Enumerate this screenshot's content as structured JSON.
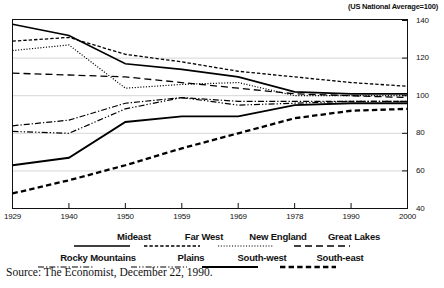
{
  "subtitle": "(US National Average=100)",
  "source": "Source: The Economist, December 22, 1990.",
  "axes": {
    "y_ticks": [
      "40",
      "60",
      "80",
      "100",
      "120",
      "140"
    ],
    "x_ticks": [
      "1929",
      "1940",
      "1950",
      "1959",
      "1969",
      "1978",
      "1990",
      "2000"
    ]
  },
  "legend": {
    "row1": [
      {
        "label": "Mideast",
        "style": "solid"
      },
      {
        "label": "Far West",
        "style": "dash"
      },
      {
        "label": "New England",
        "style": "dot"
      },
      {
        "label": "Great Lakes",
        "style": "longdash"
      }
    ],
    "row2": [
      {
        "label": "Rocky Mountains",
        "style": "dashdot"
      },
      {
        "label": "Plains",
        "style": "dashdotdot"
      },
      {
        "label": "South-west",
        "style": "solid2"
      },
      {
        "label": "South-east",
        "style": "bolddash"
      }
    ]
  },
  "chart_data": {
    "type": "line",
    "title": "",
    "subtitle": "(US National Average=100)",
    "xlabel": "",
    "ylabel": "",
    "ylim": [
      40,
      140
    ],
    "xlim": [
      1929,
      2000
    ],
    "grid": true,
    "legend_position": "below",
    "x": [
      1929,
      1940,
      1950,
      1959,
      1969,
      1978,
      1990,
      2000
    ],
    "series": [
      {
        "name": "Mideast",
        "style": "solid",
        "values": [
          138,
          132,
          117,
          114,
          110,
          102,
          101,
          101
        ]
      },
      {
        "name": "Far West",
        "style": "dash",
        "values": [
          129,
          131,
          122,
          118,
          113,
          110,
          107,
          105
        ]
      },
      {
        "name": "New England",
        "style": "dot",
        "values": [
          124,
          127,
          104,
          106,
          107,
          100,
          100,
          100
        ]
      },
      {
        "name": "Great Lakes",
        "style": "longdash",
        "values": [
          112,
          111,
          110,
          107,
          104,
          101,
          100,
          99
        ]
      },
      {
        "name": "Rocky Mountains",
        "style": "dashdot",
        "values": [
          84,
          87,
          96,
          99,
          97,
          97,
          97,
          97
        ]
      },
      {
        "name": "Plains",
        "style": "dashdotdot",
        "values": [
          81,
          80,
          93,
          99,
          95,
          96,
          97,
          97
        ]
      },
      {
        "name": "South-west",
        "style": "solid2",
        "values": [
          63,
          67,
          86,
          89,
          89,
          95,
          96,
          96
        ]
      },
      {
        "name": "South-east",
        "style": "bolddash",
        "values": [
          48,
          55,
          63,
          72,
          80,
          88,
          92,
          93
        ]
      }
    ]
  }
}
